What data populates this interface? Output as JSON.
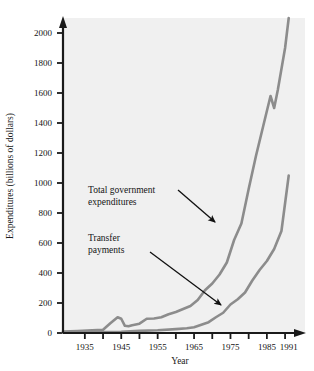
{
  "chart_data": {
    "type": "line",
    "title": "",
    "xlabel": "Year",
    "ylabel": "Expenditures (billions of dollars)",
    "xlim": [
      1929,
      1993
    ],
    "ylim": [
      0,
      2100
    ],
    "grid": false,
    "legend_position": "none",
    "xticks": [
      1935,
      1945,
      1955,
      1965,
      1975,
      1985,
      1991
    ],
    "xtick_labels": [
      "1935",
      "1945",
      "1955",
      "1965",
      "1975",
      "1985",
      "1991"
    ],
    "yticks": [
      0,
      200,
      400,
      600,
      800,
      1000,
      1200,
      1400,
      1600,
      1800,
      2000
    ],
    "ytick_labels": [
      "0",
      "200",
      "400",
      "600",
      "800",
      "1000",
      "1200",
      "1400",
      "1600",
      "1800",
      "2000"
    ],
    "series": [
      {
        "name": "Total government expenditures",
        "color": "#8c8c8c",
        "x": [
          1929,
          1933,
          1937,
          1940,
          1942,
          1944,
          1945,
          1946,
          1947,
          1948,
          1950,
          1952,
          1954,
          1956,
          1958,
          1960,
          1962,
          1964,
          1966,
          1968,
          1970,
          1972,
          1974,
          1976,
          1978,
          1980,
          1982,
          1984,
          1986,
          1987,
          1988,
          1990,
          1991
        ],
        "values": [
          10,
          13,
          18,
          22,
          65,
          105,
          95,
          48,
          45,
          52,
          62,
          95,
          97,
          105,
          125,
          140,
          160,
          180,
          220,
          285,
          330,
          390,
          470,
          620,
          730,
          960,
          1180,
          1380,
          1580,
          1500,
          1620,
          1900,
          2100
        ]
      },
      {
        "name": "Transfer payments",
        "color": "#8c8c8c",
        "x": [
          1929,
          1935,
          1940,
          1945,
          1950,
          1955,
          1960,
          1963,
          1965,
          1967,
          1969,
          1971,
          1973,
          1975,
          1977,
          1979,
          1981,
          1983,
          1985,
          1987,
          1989,
          1991
        ],
        "values": [
          2,
          5,
          6,
          8,
          14,
          18,
          26,
          32,
          38,
          55,
          72,
          105,
          135,
          190,
          225,
          270,
          350,
          420,
          480,
          560,
          680,
          1050
        ]
      }
    ],
    "annotations": [
      {
        "text_lines": [
          "Total government",
          "expenditures"
        ],
        "text_x": 88,
        "text_y": 193,
        "arrow_from_x": 178,
        "arrow_from_y": 190,
        "arrow_to_x": 215,
        "arrow_to_y": 222
      },
      {
        "text_lines": [
          "Transfer",
          "payments"
        ],
        "text_x": 88,
        "text_y": 241,
        "arrow_from_x": 150,
        "arrow_from_y": 252,
        "arrow_to_x": 221,
        "arrow_to_y": 305
      }
    ],
    "colors": {
      "plot_background": "#f0f0f0",
      "axis": "#1a1a1a",
      "line": "#8c8c8c",
      "text": "#141414",
      "page_background": "#ffffff"
    }
  }
}
